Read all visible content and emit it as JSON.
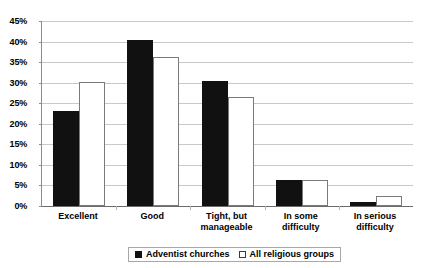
{
  "chart_data": {
    "type": "bar",
    "title": "",
    "subtitle": "",
    "xlabel": "",
    "ylabel": "",
    "categories": [
      "Excellent",
      "Tight, but",
      "Good",
      "In some",
      "In serious"
    ],
    "category_labels": [
      {
        "line1": "Excellent",
        "line2": ""
      },
      {
        "line1": "Good",
        "line2": ""
      },
      {
        "line1": "Tight, but",
        "line2": "manageable"
      },
      {
        "line1": "In some",
        "line2": "difficulty"
      },
      {
        "line1": "In serious",
        "line2": "difficulty"
      }
    ],
    "series": [
      {
        "name": "Adventist churches",
        "color": "#111111",
        "style": "filled",
        "values": [
          23.0,
          40.3,
          30.5,
          6.3,
          1.0
        ]
      },
      {
        "name": "All religious groups",
        "color": "#ffffff",
        "style": "hollow",
        "values": [
          30.2,
          36.3,
          26.5,
          6.3,
          2.4
        ]
      }
    ],
    "ylim": [
      0,
      45
    ],
    "ytick_values": [
      0,
      5,
      10,
      15,
      20,
      25,
      30,
      35,
      40,
      45
    ],
    "ytick_labels": [
      "0%",
      "5%",
      "10%",
      "15%",
      "20%",
      "25%",
      "30%",
      "35%",
      "40%",
      "45%"
    ],
    "grid": true,
    "grid_axis": "y",
    "legend_position": "bottom-center"
  },
  "legend": {
    "items": [
      {
        "label": "Adventist churches",
        "swatch": "filled-square-swatch"
      },
      {
        "label": "All religious groups",
        "swatch": "hollow-square-swatch"
      }
    ]
  }
}
